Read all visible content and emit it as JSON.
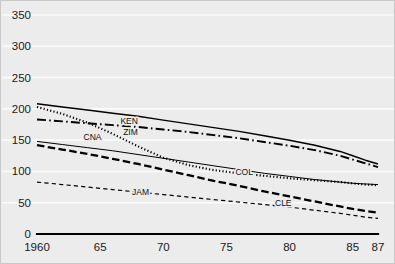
{
  "chart_data": {
    "type": "line",
    "title": "",
    "subtitle": "",
    "xlabel": "",
    "ylabel": "",
    "xlim": [
      1960,
      1987
    ],
    "ylim": [
      0,
      350
    ],
    "grid": true,
    "legend_position": "inline-labels",
    "yticks": [
      0,
      50,
      100,
      150,
      200,
      250,
      300,
      350
    ],
    "ytick_labels": [
      "0",
      "50",
      "100",
      "150",
      "200",
      "250",
      "300",
      "350"
    ],
    "xticks": [
      1960,
      1965,
      1970,
      1975,
      1980,
      1985,
      1987
    ],
    "xtick_labels": [
      "1960",
      "65",
      "70",
      "75",
      "80",
      "85",
      "87"
    ],
    "x": [
      1960,
      1962,
      1964,
      1966,
      1968,
      1970,
      1972,
      1974,
      1976,
      1978,
      1980,
      1982,
      1984,
      1985,
      1986,
      1987
    ],
    "series": [
      {
        "name": "KEN",
        "label": "KEN",
        "style": "solid",
        "width": 1.5,
        "color": "#000000",
        "label_x": 1967.3,
        "label_y": 176,
        "values": [
          208,
          203,
          198,
          193,
          188,
          182,
          176,
          170,
          164,
          157,
          150,
          142,
          132,
          125,
          118,
          112
        ]
      },
      {
        "name": "ZIM",
        "label": "ZIM",
        "style": "dash-dot",
        "width": 1.9,
        "color": "#000000",
        "label_x": 1967.4,
        "label_y": 158,
        "values": [
          183,
          180,
          177,
          174,
          171,
          167,
          163,
          158,
          153,
          147,
          141,
          134,
          125,
          119,
          113,
          107
        ]
      },
      {
        "name": "CNA",
        "label": "CNA",
        "style": "dotted",
        "width": 2.1,
        "color": "#000000",
        "label_x": 1964.4,
        "label_y": 150,
        "values": [
          203,
          192,
          178,
          160,
          140,
          122,
          110,
          102,
          97,
          93,
          89,
          86,
          83,
          81,
          79,
          78
        ]
      },
      {
        "name": "COL",
        "label": "COL",
        "style": "solid",
        "width": 1.0,
        "color": "#000000",
        "label_x": 1976.4,
        "label_y": 95,
        "values": [
          148,
          143,
          138,
          133,
          127,
          121,
          115,
          109,
          103,
          97,
          92,
          87,
          83,
          81,
          80,
          79
        ]
      },
      {
        "name": "CLE",
        "label": "CLE",
        "style": "long-dash",
        "width": 2.3,
        "color": "#000000",
        "label_x": 1979.5,
        "label_y": 45,
        "values": [
          142,
          135,
          128,
          120,
          112,
          103,
          94,
          85,
          77,
          68,
          60,
          52,
          44,
          40,
          37,
          34
        ]
      },
      {
        "name": "JAM",
        "label": "JAM",
        "style": "short-dash",
        "width": 1.2,
        "color": "#000000",
        "label_x": 1968.2,
        "label_y": 62,
        "values": [
          83,
          79,
          75,
          71,
          67,
          63,
          59,
          55,
          51,
          47,
          43,
          38,
          33,
          30,
          27,
          25
        ]
      }
    ]
  }
}
